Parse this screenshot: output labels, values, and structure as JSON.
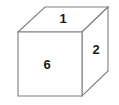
{
  "figure": {
    "name": "cube-diagram",
    "background_color": "#ffffff",
    "edge_color": "#808080",
    "face_fill_color": "#ffffff",
    "label_color": "#1a1a1a",
    "edge_width": 1.1
  },
  "faces": [
    {
      "id": "top-face",
      "label": "1",
      "position": "top",
      "label_x": 63,
      "label_y": 20,
      "points": "18,32 45,7 108,7 82,32"
    },
    {
      "id": "right-face",
      "label": "2",
      "position": "right",
      "label_x": 96,
      "label_y": 51,
      "points": "82,32 108,7 108,71 82,96"
    },
    {
      "id": "front-face",
      "label": "6",
      "position": "front",
      "label_x": 47,
      "label_y": 66,
      "points": "18,32 82,32 82,96 18,96"
    }
  ]
}
